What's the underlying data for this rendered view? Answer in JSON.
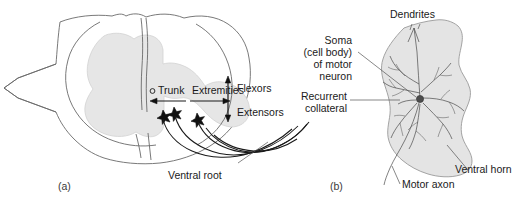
{
  "figure": {
    "panels": [
      {
        "id": "a",
        "label": "(a)",
        "caption_labels": {
          "trunk": "Trunk",
          "extremities": "Extremities",
          "flexors": "Flexors",
          "extensors": "Extensors",
          "ventral_root": "Ventral root"
        }
      },
      {
        "id": "b",
        "label": "(b)",
        "caption_labels": {
          "dendrites": "Dendrites",
          "soma_line1": "Soma",
          "soma_line2": "(cell body)",
          "soma_line3": "of motor",
          "soma_line4": "neuron",
          "recurrent_line1": "Recurrent",
          "recurrent_line2": "collateral",
          "motor_axon": "Motor axon",
          "ventral_horn": "Ventral horn"
        }
      }
    ]
  },
  "colors": {
    "background": "#ffffff",
    "outline_stroke": "#6a6a6a",
    "gray_matter_fill": "#e6e6e6",
    "horn_fill": "#e4e4e4",
    "label_text": "#1a1a1a",
    "fiber_stroke": "#1a1a1a",
    "neurite_stroke": "#4a4a4a",
    "soma_fill": "#4d4d4d",
    "leader_stroke": "#555555"
  }
}
